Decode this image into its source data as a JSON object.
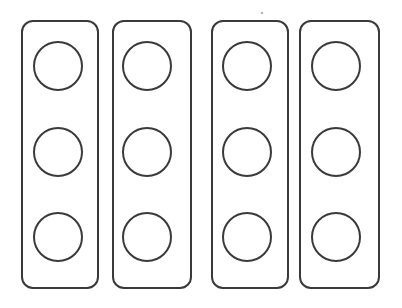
{
  "page": {
    "title": "",
    "background_color": "#ffffff",
    "width": 402,
    "height": 308
  },
  "style": {
    "stroke_color": "#3a3a3a",
    "stroke_width": 2,
    "fill_color": "#ffffff",
    "corner_radius": 11
  },
  "figure": {
    "kind": "blank-counting-strips",
    "strip_count": 4,
    "circles_per_strip": 3,
    "total_circles": 12,
    "circle_diameter": 48
  },
  "strips": [
    {
      "name": "strip-1",
      "x": 22,
      "y": 21,
      "width": 76,
      "height": 267,
      "circles": [
        {
          "name": "circle-1-1",
          "cx": 58,
          "cy": 66,
          "r": 24,
          "label": ""
        },
        {
          "name": "circle-1-2",
          "cx": 58,
          "cy": 152,
          "r": 24,
          "label": ""
        },
        {
          "name": "circle-1-3",
          "cx": 58,
          "cy": 237,
          "r": 24,
          "label": ""
        }
      ]
    },
    {
      "name": "strip-2",
      "x": 113,
      "y": 21,
      "width": 78,
      "height": 267,
      "circles": [
        {
          "name": "circle-2-1",
          "cx": 147,
          "cy": 66,
          "r": 24,
          "label": ""
        },
        {
          "name": "circle-2-2",
          "cx": 147,
          "cy": 152,
          "r": 24,
          "label": ""
        },
        {
          "name": "circle-2-3",
          "cx": 147,
          "cy": 237,
          "r": 24,
          "label": ""
        }
      ]
    },
    {
      "name": "strip-3",
      "x": 212,
      "y": 21,
      "width": 76,
      "height": 267,
      "circles": [
        {
          "name": "circle-3-1",
          "cx": 247,
          "cy": 66,
          "r": 24,
          "label": ""
        },
        {
          "name": "circle-3-2",
          "cx": 247,
          "cy": 152,
          "r": 24,
          "label": ""
        },
        {
          "name": "circle-3-3",
          "cx": 247,
          "cy": 237,
          "r": 24,
          "label": ""
        }
      ]
    },
    {
      "name": "strip-4",
      "x": 300,
      "y": 21,
      "width": 79,
      "height": 267,
      "circles": [
        {
          "name": "circle-4-1",
          "cx": 336,
          "cy": 66,
          "r": 24,
          "label": ""
        },
        {
          "name": "circle-4-2",
          "cx": 336,
          "cy": 152,
          "r": 24,
          "label": ""
        },
        {
          "name": "circle-4-3",
          "cx": 336,
          "cy": 237,
          "r": 24,
          "label": ""
        }
      ]
    }
  ],
  "marks": [
    {
      "name": "speck-mark",
      "cx": 262,
      "cy": 13,
      "r": 1.3
    }
  ]
}
